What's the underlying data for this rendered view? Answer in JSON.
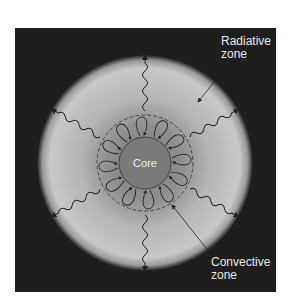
{
  "diagram": {
    "type": "star interior cross-section",
    "labels": {
      "core": "Core",
      "radiative_zone": [
        "Radiative",
        "zone"
      ],
      "convective_zone": [
        "Convective",
        "zone"
      ]
    },
    "colors": {
      "background": "#1e1e1e",
      "star_outer": "#c8c8c8",
      "star_inner": "#8a8a8a",
      "core": "#7a7a7a",
      "lines": "#222222",
      "text": "#e8e8e8"
    },
    "elements": {
      "wavy_arrows_count": 6,
      "convection_loops_count": 12
    }
  }
}
